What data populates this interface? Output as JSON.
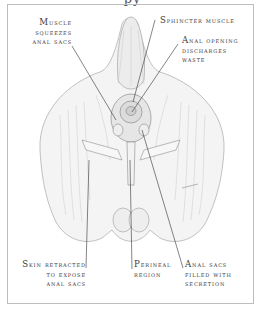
{
  "title_fragment": "py",
  "labels": {
    "muscle_squeezes": [
      "Muscle",
      "squeezes",
      "anal sacs"
    ],
    "sphincter": [
      "Sphincter muscle"
    ],
    "anal_opening": [
      "Anal opening",
      "discharges",
      "waste"
    ],
    "skin_retracted": [
      "Skin retracted",
      "to expose",
      "anal sacs"
    ],
    "perineal": [
      "Perineal",
      "region"
    ],
    "anal_sacs_filled": [
      "Anal sacs",
      "filled with",
      "secretion"
    ]
  },
  "colors": {
    "frame": "#bdbdbd",
    "text": "#3a3a3a",
    "leader": "#333333",
    "drawing_stroke": "#9a9a9a",
    "drawing_fill": "#f3f3f3"
  }
}
